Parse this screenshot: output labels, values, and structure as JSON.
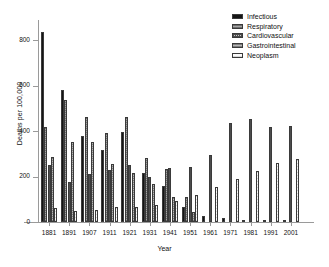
{
  "chart_data": {
    "type": "bar",
    "title": "",
    "xlabel": "Year",
    "ylabel": "Deaths per 100,000",
    "ylim": [
      0,
      880
    ],
    "yticks": [
      0,
      200,
      400,
      600,
      800
    ],
    "grid": false,
    "legend_position": "top-right",
    "categories": [
      "1881",
      "1891",
      "1907",
      "1911",
      "1921",
      "1931",
      "1941",
      "1951",
      "1961",
      "1971",
      "1981",
      "1991",
      "2001"
    ],
    "series": [
      {
        "name": "Infectious",
        "color": "#151515",
        "pattern": "solid",
        "values": [
          835,
          580,
          378,
          318,
          398,
          217,
          158,
          67,
          25,
          18,
          9,
          5,
          10
        ]
      },
      {
        "name": "Respiratory",
        "color": "#8e8e8e",
        "pattern": "horizontal-lines",
        "values": [
          418,
          535,
          460,
          391,
          463,
          283,
          233,
          110,
          0,
          0,
          0,
          0,
          0
        ]
      },
      {
        "name": "Cardiovascular",
        "color": "#c9c9c9",
        "pattern": "cross-hatch",
        "values": [
          250,
          174,
          211,
          231,
          251,
          199,
          236,
          240,
          294,
          436,
          455,
          420,
          422
        ]
      },
      {
        "name": "Gastrointestinal",
        "color": "#9d9d9d",
        "pattern": "horizontal-lines",
        "values": [
          286,
          353,
          350,
          257,
          214,
          168,
          108,
          44,
          0,
          0,
          0,
          0,
          0
        ]
      },
      {
        "name": "Neoplasm",
        "color": "#f2f2f2",
        "pattern": "light-lines",
        "values": [
          63,
          47,
          55,
          64,
          68,
          75,
          94,
          117,
          156,
          190,
          223,
          261,
          277
        ]
      }
    ]
  },
  "legend": {
    "items": [
      {
        "label": "Infectious"
      },
      {
        "label": "Respiratory"
      },
      {
        "label": "Cardiovascular"
      },
      {
        "label": "Gastrointestinal"
      },
      {
        "label": "Neoplasm"
      }
    ]
  },
  "axes": {
    "y_title": "Deaths per 100,000",
    "x_title": "Year",
    "y_tick_labels": [
      "800",
      "600",
      "400",
      "200",
      "0"
    ],
    "x_tick_labels": [
      "1881",
      "1891",
      "1907",
      "1911",
      "1921",
      "1931",
      "1941",
      "1951",
      "1961",
      "1971",
      "1981",
      "1991",
      "2001"
    ]
  }
}
